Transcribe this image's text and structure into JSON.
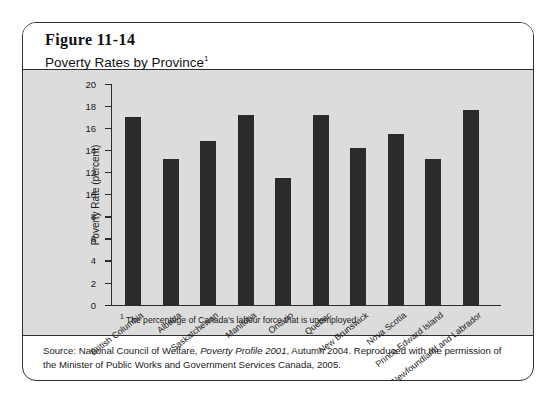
{
  "figure": {
    "number": "Figure 11-14",
    "title": "Poverty Rates by Province",
    "title_superscript": "1",
    "footnote_marker": "1",
    "footnote": "The percentage of Canada's labour force that is unemployed.",
    "source_prefix": "Source: National Council of Welfare, ",
    "source_italic": "Poverty Profile 2001",
    "source_suffix": ", Autumn 2004. Reproduced with the permission of the Minister of Public Works and Government Services Canada, 2005."
  },
  "colors": {
    "bar": "#2b2b2b",
    "panel": "#dcdcdc",
    "border": "#2f2f2f",
    "text": "#1a1a1a"
  },
  "chart_data": {
    "type": "bar",
    "title": "Poverty Rates by Province",
    "xlabel": "",
    "ylabel": "Poverty Rate (percent)",
    "ylim": [
      0,
      20
    ],
    "ytick_step": 2,
    "yticks": [
      0,
      2,
      4,
      6,
      8,
      10,
      12,
      14,
      16,
      18,
      20
    ],
    "grid": false,
    "legend": null,
    "categories": [
      "British Columbia",
      "Alberta",
      "Saskatchewan",
      "Manitoba",
      "Ontario",
      "Quebec",
      "New Brunswick",
      "Nova Scotia",
      "Prince Edward Island",
      "Newfoundland and Labrador"
    ],
    "values": [
      17.0,
      13.2,
      14.8,
      17.2,
      11.5,
      17.2,
      14.2,
      15.5,
      13.2,
      17.6
    ]
  }
}
